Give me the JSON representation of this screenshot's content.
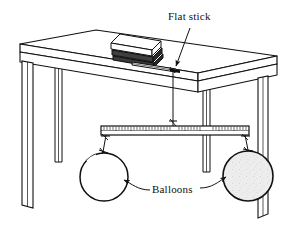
{
  "figure": {
    "kind": "science-diagram",
    "background_color": "#ffffff",
    "ink_color": "#111111",
    "labels": {
      "flat_stick": "Flat stick",
      "balloons": "Balloons"
    },
    "objects": {
      "table": {
        "name": "table",
        "legs_count": 4,
        "fill_color": "#ffffff",
        "edge_color": "#111111"
      },
      "books": {
        "name": "stack-of-books",
        "count": 3,
        "fill_color": "#3a3a3a"
      },
      "flat_stick": {
        "name": "flat-stick",
        "description": "flat stick pinned under books, projecting past table edge"
      },
      "string": {
        "name": "suspension-string",
        "description": "string from stick tip down to centre of ruler"
      },
      "ruler": {
        "name": "ruler-beam",
        "tick_count": 52,
        "fill_color": "#ffffff"
      },
      "balloon_left": {
        "name": "balloon-left",
        "state": "uninflated",
        "fill_color": "#ffffff"
      },
      "balloon_right": {
        "name": "balloon-right",
        "state": "inflated",
        "fill_color": "#eeeeee"
      }
    }
  }
}
